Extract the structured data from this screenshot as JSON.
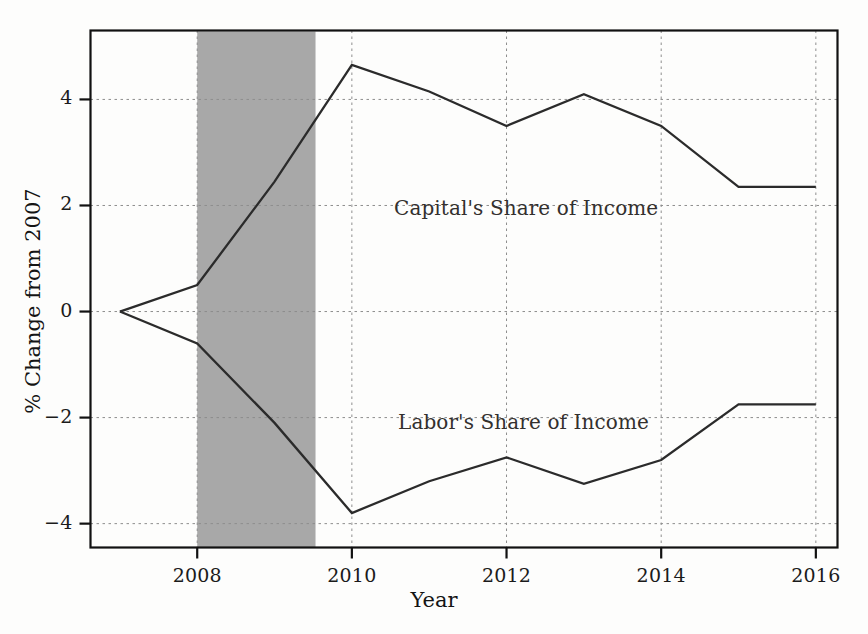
{
  "chart_data": {
    "type": "line",
    "title": "",
    "xlabel": "Year",
    "ylabel": "% Change from 2007",
    "x": [
      2007,
      2008,
      2009,
      2010,
      2011,
      2012,
      2013,
      2014,
      2015,
      2016
    ],
    "xlim": [
      2006.62,
      2016.28
    ],
    "ylim": [
      -4.45,
      5.3
    ],
    "xticks": [
      2008,
      2010,
      2012,
      2014,
      2016
    ],
    "xtick_labels": [
      "2008",
      "2010",
      "2012",
      "2014",
      "2016"
    ],
    "yticks": [
      -4,
      -2,
      0,
      2,
      4
    ],
    "ytick_labels": [
      "−4",
      "−2",
      "0",
      "2",
      "4"
    ],
    "grid": "dashed-both-axes",
    "legend_position": "inline-annotations",
    "series": [
      {
        "name": "Capital's Share of Income",
        "color": "#2b2b2b",
        "values": [
          0.0,
          0.5,
          2.45,
          4.65,
          4.15,
          3.5,
          4.1,
          3.5,
          2.35,
          2.35
        ]
      },
      {
        "name": "Labor's Share of Income",
        "color": "#2b2b2b",
        "values": [
          0.0,
          -0.6,
          -2.1,
          -3.8,
          -3.2,
          -2.75,
          -3.25,
          -2.8,
          -1.75,
          -1.75
        ]
      }
    ],
    "shaded_regions": [
      {
        "name": "recession-band",
        "x_start": 2008.0,
        "x_end": 2009.53,
        "color": "#a8a8a8"
      }
    ],
    "annotations": [
      {
        "name": "capital-series-label",
        "text": "Capital's Share of Income"
      },
      {
        "name": "labor-series-label",
        "text": "Labor's Share of Income"
      }
    ]
  },
  "axes": {
    "x_title": "Year",
    "y_title": "% Change from 2007"
  },
  "ticks": {
    "x": [
      "2008",
      "2010",
      "2012",
      "2014",
      "2016"
    ],
    "y": [
      "4",
      "2",
      "0",
      "−2",
      "−4"
    ]
  },
  "labels": {
    "capital": "Capital's Share of Income",
    "labor": "Labor's Share of Income"
  },
  "colors": {
    "line": "#2b2b2b",
    "frame": "#111111",
    "grid": "#8d8d8d",
    "recession_band": "#a8a8a8",
    "background": "#fdfdfc",
    "text": "#141414"
  }
}
